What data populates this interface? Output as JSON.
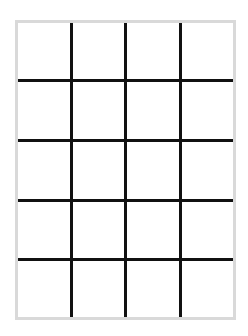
{
  "grid": {
    "columns": 4,
    "rows": 5,
    "frame_color": "#d9d9d9",
    "line_color": "#111111",
    "background_color": "#ffffff"
  }
}
